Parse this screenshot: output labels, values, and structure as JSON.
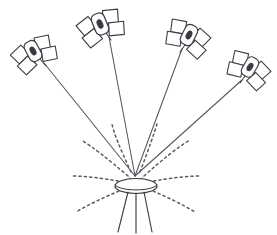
{
  "figure": {
    "title": "Satellite constellation transmitting to a ground receiver antenna",
    "kind": "line-drawing",
    "background_color": "#ffffff",
    "line_color": "#4a4a52",
    "dash_color": "#5a5a62",
    "width": 277,
    "height": 235
  },
  "ground_station": {
    "name": "ground-receiver-antenna",
    "label": "",
    "convergence_point": {
      "x": 135,
      "y": 176
    },
    "dish": {
      "cx": 136,
      "cy": 186,
      "rx": 21,
      "ry": 7.5
    },
    "tripod_leg_count": 3,
    "legs": [
      {
        "x1": 128,
        "y1": 192,
        "x2": 118,
        "y2": 232
      },
      {
        "x1": 136,
        "y1": 193,
        "x2": 136,
        "y2": 233
      },
      {
        "x1": 144,
        "y1": 192,
        "x2": 152,
        "y2": 232
      }
    ],
    "mast": [
      {
        "x1": 130,
        "y1": 178,
        "x2": 128,
        "y2": 193
      },
      {
        "x1": 142,
        "y1": 178,
        "x2": 144,
        "y2": 193
      }
    ]
  },
  "satellites": [
    {
      "id": "satellite-1",
      "label": "",
      "position": {
        "x": 33,
        "y": 51
      },
      "rotation_deg": -28,
      "scale": 1.0,
      "beam": {
        "from_x": 44,
        "from_y": 63,
        "to_x": 135,
        "to_y": 176
      },
      "mast": {
        "x1": 40,
        "y1": 59,
        "x2": 46,
        "y2": 66
      }
    },
    {
      "id": "satellite-2",
      "label": "",
      "position": {
        "x": 100,
        "y": 24
      },
      "rotation_deg": -22,
      "scale": 1.04,
      "beam": {
        "from_x": 109,
        "from_y": 37,
        "to_x": 135,
        "to_y": 176
      },
      "mast": {
        "x1": 106,
        "y1": 33,
        "x2": 111,
        "y2": 40
      }
    },
    {
      "id": "satellite-3",
      "label": "",
      "position": {
        "x": 189,
        "y": 35
      },
      "rotation_deg": 26,
      "scale": 1.0,
      "beam": {
        "from_x": 182,
        "from_y": 49,
        "to_x": 135,
        "to_y": 176
      },
      "mast": {
        "x1": 185,
        "y1": 45,
        "x2": 180,
        "y2": 52
      }
    },
    {
      "id": "satellite-4",
      "label": "",
      "position": {
        "x": 250,
        "y": 67
      },
      "rotation_deg": 30,
      "scale": 0.97,
      "beam": {
        "from_x": 242,
        "from_y": 80,
        "to_x": 135,
        "to_y": 176
      },
      "mast": {
        "x1": 245,
        "y1": 76,
        "x2": 240,
        "y2": 83
      }
    }
  ],
  "radiation_lobes": {
    "name": "antenna-radiation-pattern",
    "style": "dashed-arcs",
    "count": 8,
    "arcs": [
      {
        "id": "lobe-left-1",
        "d": "M 131 172 C 120 148 114 134 112 124"
      },
      {
        "id": "lobe-left-2",
        "d": "M 128 176 C 108 159 93 147 81 140"
      },
      {
        "id": "lobe-left-3",
        "d": "M 124 182 C 101 178 85 176 71 176"
      },
      {
        "id": "lobe-left-4",
        "d": "M 124 189 C 104 197 88 205 76 212"
      },
      {
        "id": "lobe-right-1",
        "d": "M 140 172 C 149 148 154 134 157 124"
      },
      {
        "id": "lobe-right-2",
        "d": "M 144 176 C 163 159 178 147 190 140"
      },
      {
        "id": "lobe-right-3",
        "d": "M 148 182 C 170 178 187 176 201 176"
      },
      {
        "id": "lobe-right-4",
        "d": "M 148 189 C 168 197 183 205 195 212"
      }
    ]
  },
  "satellite_geometry": {
    "body": {
      "w": 13,
      "h": 21,
      "corner_r": 5
    },
    "core_oval": {
      "rx": 2.6,
      "ry": 4.4
    },
    "panel": {
      "w": 14,
      "h": 12.5,
      "skew_deg": -16
    },
    "panel_positions": [
      "upper-left",
      "lower-left",
      "upper-right",
      "lower-right"
    ]
  }
}
